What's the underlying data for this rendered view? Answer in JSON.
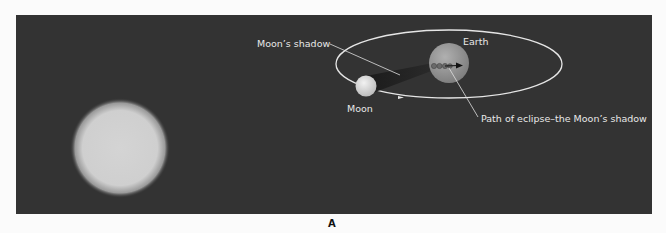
{
  "figure": {
    "panel_label": "A",
    "colors": {
      "background": "#333333",
      "page": "#fbfbfb",
      "orbit": "#e6e6e6",
      "label_text": "#e8e8e8",
      "sun": "#d9d9d9",
      "moon": "#e0e0e0",
      "earth": "#9a9a9a",
      "shadow": "#1e1e1e"
    },
    "labels": {
      "moon_shadow": "Moon’s shadow",
      "earth": "Earth",
      "moon": "Moon",
      "eclipse_path": "Path of eclipse–the Moon’s shadow"
    }
  }
}
